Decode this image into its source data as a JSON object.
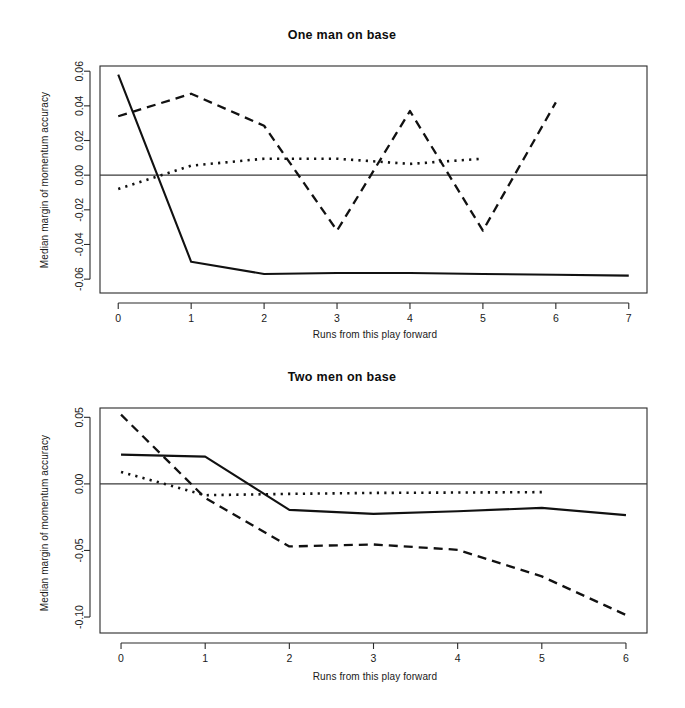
{
  "figure": {
    "width": 685,
    "height": 708,
    "background": "#ffffff",
    "ink_color": "#111111"
  },
  "panels": [
    {
      "id": "one-man-on-base",
      "title": "One man on base",
      "xlabel": "Runs from this play forward",
      "ylabel": "Median margin of momentum accuracy"
    },
    {
      "id": "two-men-on-base",
      "title": "Two men on base",
      "xlabel": "Runs from this play forward",
      "ylabel": "Median margin of momentum accuracy"
    }
  ],
  "chart_data": [
    {
      "type": "line",
      "title": "One man on base",
      "xlabel": "Runs from this play forward",
      "ylabel": "Median margin of momentum accuracy",
      "xlim": [
        -0.25,
        7.25
      ],
      "ylim": [
        -0.068,
        0.063
      ],
      "xticks": [
        0,
        1,
        2,
        3,
        4,
        5,
        6,
        7
      ],
      "xtick_labels": [
        "0",
        "1",
        "2",
        "3",
        "4",
        "5",
        "6",
        "7"
      ],
      "yticks": [
        0.06,
        0.04,
        0.02,
        0.0,
        -0.02,
        -0.04,
        -0.06
      ],
      "ytick_labels": [
        "0.06",
        "0.04",
        "0.02",
        "0.00",
        "-0.02",
        "-0.04",
        "-0.06"
      ],
      "grid": false,
      "legend": "none",
      "zero_reference_line": 0.0,
      "series": [
        {
          "name": "solid",
          "style": "solid",
          "x": [
            0,
            1,
            2,
            3,
            4,
            5,
            6,
            7
          ],
          "values": [
            0.058,
            -0.05,
            -0.057,
            -0.0565,
            -0.0565,
            -0.057,
            -0.0575,
            -0.058
          ]
        },
        {
          "name": "dashed",
          "style": "dashed",
          "x": [
            0,
            1,
            2,
            3,
            4,
            5,
            6
          ],
          "values": [
            0.034,
            0.047,
            0.0285,
            -0.032,
            0.037,
            -0.032,
            0.042
          ]
        },
        {
          "name": "dotted",
          "style": "dotted",
          "x": [
            0,
            1,
            2,
            3,
            4,
            5
          ],
          "values": [
            -0.008,
            0.0055,
            0.0095,
            0.0095,
            0.0065,
            0.0095
          ]
        }
      ]
    },
    {
      "type": "line",
      "title": "Two men on base",
      "xlabel": "Runs from this play forward",
      "ylabel": "Median margin of momentum accuracy",
      "xlim": [
        -0.25,
        6.25
      ],
      "ylim": [
        -0.112,
        0.057
      ],
      "xticks": [
        0,
        1,
        2,
        3,
        4,
        5,
        6
      ],
      "xtick_labels": [
        "0",
        "1",
        "2",
        "3",
        "4",
        "5",
        "6"
      ],
      "yticks": [
        0.05,
        0.0,
        -0.05,
        -0.1
      ],
      "ytick_labels": [
        "0.05",
        "0.00",
        "-0.05",
        "-0.10"
      ],
      "grid": false,
      "legend": "none",
      "zero_reference_line": 0.0,
      "series": [
        {
          "name": "solid",
          "style": "solid",
          "x": [
            0,
            1,
            2,
            3,
            4,
            5,
            6
          ],
          "values": [
            0.022,
            0.0205,
            -0.0195,
            -0.0225,
            -0.0205,
            -0.018,
            -0.0235
          ]
        },
        {
          "name": "dashed",
          "style": "dashed",
          "x": [
            0,
            1,
            2,
            3,
            4,
            5,
            6
          ],
          "values": [
            0.052,
            -0.0105,
            -0.047,
            -0.0455,
            -0.0495,
            -0.0695,
            -0.0985
          ]
        },
        {
          "name": "dotted",
          "style": "dotted",
          "x": [
            0,
            1,
            2,
            3,
            4,
            5
          ],
          "values": [
            0.009,
            -0.0085,
            -0.0075,
            -0.0068,
            -0.0065,
            -0.0062
          ]
        }
      ]
    }
  ]
}
